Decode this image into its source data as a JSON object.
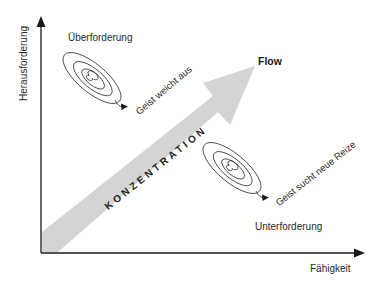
{
  "diagram": {
    "type": "flow-model",
    "axes": {
      "y_label": "Herausforderung",
      "x_label": "Fähigkeit"
    },
    "arrow": {
      "label": "KONZENTRATION",
      "target_label": "Flow",
      "color": "#d4d4d4"
    },
    "regions": {
      "upper": {
        "label": "Überforderung",
        "spiral_caption": "Geist weicht aus"
      },
      "lower": {
        "label": "Unterforderung",
        "spiral_caption": "Geist sucht neue Reize"
      }
    },
    "colors": {
      "axis": "#1a1a1a",
      "spiral": "#333333",
      "text": "#2a2a2a"
    }
  }
}
